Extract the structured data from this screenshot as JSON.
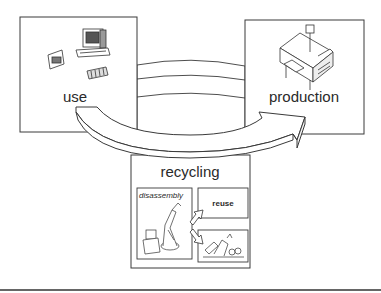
{
  "diagram": {
    "nodes": {
      "use": {
        "label": "use",
        "icon": "computer-equipment-icon"
      },
      "production": {
        "label": "production",
        "icon": "factory-machine-icon"
      },
      "recycling": {
        "label": "recycling",
        "sub": {
          "disassembly": {
            "label": "disassembly",
            "icon": "robot-arm-icon"
          },
          "reuse": {
            "label": "reuse"
          },
          "material": {
            "icon": "scrap-material-icon"
          }
        }
      }
    },
    "edges": [
      {
        "from": "use",
        "to": "production",
        "style": "curved-arrow"
      },
      {
        "from": "production",
        "to": "use",
        "style": "band"
      },
      {
        "from": "disassembly",
        "to": "reuse",
        "style": "small-arrow"
      },
      {
        "from": "disassembly",
        "to": "material",
        "style": "small-arrow"
      }
    ],
    "colors": {
      "stroke": "#3a3a3a",
      "fill": "#ffffff",
      "text": "#2a2a2a"
    }
  }
}
